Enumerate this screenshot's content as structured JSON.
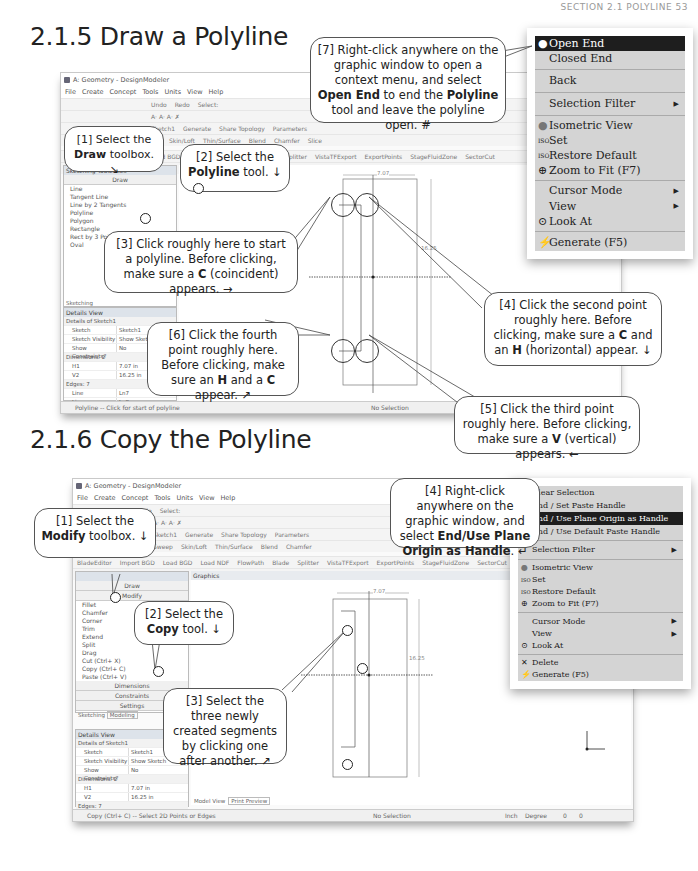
{
  "page_header": "SECTION 2.1 POLYLINE  53",
  "section_1": {
    "title": "2.1.5  Draw a Polyline",
    "window": {
      "title": "A: Geometry - DesignModeler",
      "menu": [
        "File",
        "Create",
        "Concept",
        "Tools",
        "Units",
        "View",
        "Help"
      ],
      "toolbar1": [
        "Undo",
        "Redo",
        "Select:"
      ],
      "toolbar3": [
        "Sketch1",
        "Generate",
        "Share Topology",
        "Parameters"
      ],
      "toolbar4": [
        "Sweep",
        "Skin/Loft",
        "Thin/Surface",
        "Blend",
        "Chamfer",
        "Slice"
      ],
      "toolbar5": [
        "BladeEditor",
        "Import BGD",
        "Load BGD",
        "Load NDF",
        "FlowPath",
        "Blade",
        "Splitter",
        "VistaTFExport",
        "ExportPoints",
        "StageFluidZone",
        "SectorCut"
      ],
      "toolbox_header": "Sketching Toolboxes",
      "draw_group": "Draw",
      "draw_tools": [
        "Line",
        "Tangent Line",
        "Line by 2 Tangents",
        "Polyline",
        "Polygon",
        "Rectangle",
        "Rect by 3 Points",
        "Oval"
      ],
      "sketching_tab": "Sketching",
      "details_title": "Details View",
      "details_group": "Details of Sketch1",
      "details_rows": [
        {
          "k": "Sketch",
          "v": "Sketch1"
        },
        {
          "k": "Sketch Visibility",
          "v": "Show Sketch"
        },
        {
          "k": "Show Constraints?",
          "v": "No"
        }
      ],
      "dimensions_group": "Dimensions: 2",
      "dimensions": [
        {
          "k": "H1",
          "v": "7.07 in"
        },
        {
          "k": "V2",
          "v": "16.25 in"
        }
      ],
      "edges_group": "Edges: 7",
      "edges": [
        {
          "k": "Line",
          "v": "Ln7"
        },
        {
          "k": "Line",
          "v": "Ln8"
        }
      ],
      "status_left": "Polyline -- Click for start of polyline",
      "status_mid": "No Selection",
      "dim_h": "7.07",
      "dim_v": "16.25"
    },
    "context_menu": {
      "items": [
        {
          "label": "Open End",
          "selected": true
        },
        {
          "label": "Closed End"
        },
        {
          "sep": true
        },
        {
          "label": "Back"
        },
        {
          "sep": true
        },
        {
          "label": "Selection Filter",
          "submenu": true
        },
        {
          "sep": true
        },
        {
          "label": "Isometric View",
          "icon": "sphere"
        },
        {
          "label": "Set",
          "icon": "iso"
        },
        {
          "label": "Restore Default",
          "icon": "iso"
        },
        {
          "label": "Zoom to Fit (F7)",
          "icon": "zoom"
        },
        {
          "sep": true
        },
        {
          "label": "Cursor Mode",
          "submenu": true
        },
        {
          "label": "View",
          "submenu": true
        },
        {
          "label": "Look At",
          "icon": "look"
        },
        {
          "sep": true
        },
        {
          "label": "Generate (F5)",
          "icon": "generate"
        }
      ]
    },
    "callouts": {
      "c1": {
        "pre": "[1] Select the ",
        "bold": "Draw",
        "post": " toolbox. ↘"
      },
      "c2": {
        "pre": "[2] Select the ",
        "bold": "Polyline",
        "post": " tool. ↓"
      },
      "c3": {
        "text": "[3] Click roughly here to start a polyline.  Before clicking, make sure a ",
        "bold": "C",
        "post": " (coincident) appears. →"
      },
      "c4": {
        "text": "[4] Click the second point roughly here.  Before clicking, make sure a ",
        "b1": "C",
        "mid": " and an ",
        "b2": "H",
        "post": " (horizontal) appear. ↓"
      },
      "c5": {
        "text": "[5] Click the third point roughly here.  Before clicking, make sure a ",
        "bold": "V",
        "post": " (vertical) appears. ←"
      },
      "c6": {
        "text": "[6] Click the fourth point roughly here.  Before clicking, make sure an ",
        "b1": "H",
        "mid": " and a ",
        "b2": "C",
        "post": " appear. ↗"
      },
      "c7": {
        "text": "[7] Right-click anywhere on the graphic window to open a context menu, and select ",
        "b1": "Open End",
        "mid": " to end the ",
        "b2": "Polyline",
        "post": " tool and leave the polyline open.  #"
      }
    }
  },
  "section_2": {
    "title": "2.1.6  Copy the Polyline",
    "window": {
      "title": "A: Geometry - DesignModeler",
      "menu": [
        "File",
        "Create",
        "Concept",
        "Tools",
        "Units",
        "View",
        "Help"
      ],
      "toolbar1": [
        "Undo",
        "Redo",
        "Select:"
      ],
      "toolbar3": [
        "Sketch1",
        "Generate",
        "Share Topology",
        "Parameters"
      ],
      "toolbar4": [
        "Sweep",
        "Skin/Loft",
        "Thin/Surface",
        "Blend",
        "Chamfer"
      ],
      "toolbar5": [
        "BladeEditor",
        "Import BGD",
        "Load BGD",
        "Load NDF",
        "FlowPath",
        "Blade",
        "Splitter",
        "VistaTFExport",
        "ExportPoints",
        "StageFluidZone",
        "SectorCut"
      ],
      "graphics_label": "Graphics",
      "draw_group": "Draw",
      "modify_group": "Modify",
      "modify_tools": [
        "Fillet",
        "Chamfer",
        "Corner",
        "Trim",
        "Extend",
        "Split",
        "Drag",
        "Cut (Ctrl+ X)",
        "Copy (Ctrl+ C)",
        "Paste (Ctrl+ V)"
      ],
      "other_groups": [
        "Dimensions",
        "Constraints",
        "Settings"
      ],
      "tabs": [
        "Sketching",
        "Modeling"
      ],
      "details_title": "Details View",
      "details_group": "Details of Sketch1",
      "details_rows": [
        {
          "k": "Sketch",
          "v": "Sketch1"
        },
        {
          "k": "Sketch Visibility",
          "v": "Show Sketch"
        },
        {
          "k": "Show Constraints?",
          "v": "No"
        }
      ],
      "dimensions_group": "Dimensions: 2",
      "dimensions": [
        {
          "k": "H1",
          "v": "7.07 in"
        },
        {
          "k": "V2",
          "v": "16.25 in"
        }
      ],
      "edges_group": "Edges: 7",
      "view_tabs": [
        "Model View",
        "Print Preview"
      ],
      "status_left": "Copy (Ctrl+ C) -- Select 2D Points or Edges",
      "status_mid": "No Selection",
      "status_units": "Inch",
      "status_angle": "Degree",
      "status_n1": "0",
      "status_n2": "0",
      "dim_h": "7.07",
      "dim_v": "16.25"
    },
    "context_menu": {
      "items": [
        {
          "label": "Clear Selection"
        },
        {
          "label": "End / Set Paste Handle"
        },
        {
          "label": "End / Use Plane Origin as Handle",
          "selected": true
        },
        {
          "label": "End / Use Default Paste Handle"
        },
        {
          "sep": true
        },
        {
          "label": "Selection Filter",
          "submenu": true
        },
        {
          "sep": true
        },
        {
          "label": "Isometric View",
          "icon": "sphere"
        },
        {
          "label": "Set",
          "icon": "iso"
        },
        {
          "label": "Restore Default",
          "icon": "iso"
        },
        {
          "label": "Zoom to Fit (F7)",
          "icon": "zoom"
        },
        {
          "sep": true
        },
        {
          "label": "Cursor Mode",
          "submenu": true
        },
        {
          "label": "View",
          "submenu": true
        },
        {
          "label": "Look At",
          "icon": "look"
        },
        {
          "sep": true
        },
        {
          "label": "Delete",
          "icon": "delete"
        },
        {
          "label": "Generate (F5)",
          "icon": "generate"
        }
      ]
    },
    "callouts": {
      "c1": {
        "pre": "[1] Select the ",
        "bold": "Modify",
        "post": " toolbox. ↓"
      },
      "c2": {
        "pre": "[2] Select the ",
        "bold": "Copy",
        "post": " tool. ↓"
      },
      "c3": {
        "text": "[3] Select the three newly created segments by clicking one after another. ↗"
      },
      "c4": {
        "text": "[4] Right-click anywhere on the graphic window, and select ",
        "bold": "End/Use Plane Origin as Handle",
        "post": ". ↵"
      }
    }
  }
}
